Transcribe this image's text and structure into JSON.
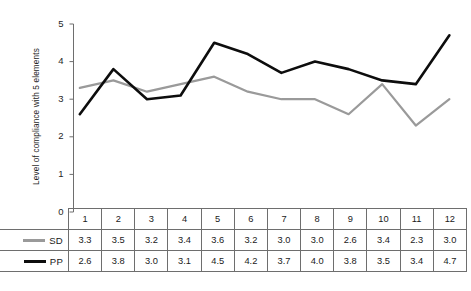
{
  "chart_data": {
    "type": "line",
    "title": "",
    "xlabel": "",
    "ylabel": "Level of compliance with 5 elements",
    "categories": [
      "1",
      "2",
      "3",
      "4",
      "5",
      "6",
      "7",
      "8",
      "9",
      "10",
      "11",
      "12"
    ],
    "ylim": [
      0,
      5
    ],
    "yticks": [
      "0",
      "1",
      "2",
      "3",
      "4",
      "5"
    ],
    "grid": false,
    "legend_position": "table-left",
    "series": [
      {
        "name": "SD",
        "color": "#9a9a9a",
        "values": [
          3.3,
          3.5,
          3.2,
          3.4,
          3.6,
          3.2,
          3.0,
          3.0,
          2.6,
          3.4,
          2.3,
          3.0
        ]
      },
      {
        "name": "PP",
        "color": "#0d0d0d",
        "values": [
          2.6,
          3.8,
          3.0,
          3.1,
          4.5,
          4.2,
          3.7,
          4.0,
          3.8,
          3.5,
          3.4,
          4.7
        ]
      }
    ]
  },
  "table": {
    "header": [
      "1",
      "2",
      "3",
      "4",
      "5",
      "6",
      "7",
      "8",
      "9",
      "10",
      "11",
      "12"
    ],
    "rows": [
      {
        "label": "SD",
        "values": [
          "3.3",
          "3.5",
          "3.2",
          "3.4",
          "3.6",
          "3.2",
          "3.0",
          "3.0",
          "2.6",
          "3.4",
          "2.3",
          "3.0"
        ]
      },
      {
        "label": "PP",
        "values": [
          "2.6",
          "3.8",
          "3.0",
          "3.1",
          "4.5",
          "4.2",
          "3.7",
          "4.0",
          "3.8",
          "3.5",
          "3.4",
          "4.7"
        ]
      }
    ]
  }
}
